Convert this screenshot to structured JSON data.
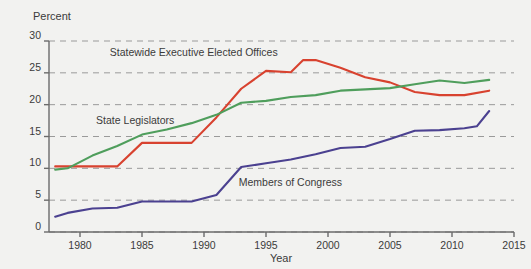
{
  "chart_data": {
    "type": "line",
    "title": "",
    "xlabel": "Year",
    "ylabel": "Percent",
    "xlim": [
      1978,
      2015
    ],
    "ylim": [
      0,
      30
    ],
    "xticks": [
      1980,
      1985,
      1990,
      1995,
      2000,
      2005,
      2010,
      2015
    ],
    "yticks": [
      0,
      5,
      10,
      15,
      20,
      25,
      30
    ],
    "grid": "horizontal-dashed",
    "legend": "inline-annotations",
    "series": [
      {
        "name": "Statewide Executive Elected Offices",
        "color": "#d8422f",
        "label_x": 1982.4,
        "label_y": 27.6,
        "x": [
          1978,
          1979,
          1981,
          1983,
          1985,
          1987,
          1989,
          1991,
          1993,
          1995,
          1997,
          1998,
          1999,
          2001,
          2003,
          2005,
          2007,
          2009,
          2011,
          2013
        ],
        "y": [
          10.3,
          10.3,
          10.3,
          10.3,
          14.0,
          14.0,
          14.0,
          18.0,
          22.5,
          25.3,
          25.1,
          27.0,
          27.0,
          25.8,
          24.3,
          23.5,
          22.0,
          21.5,
          21.5,
          22.2
        ]
      },
      {
        "name": "State Legislators",
        "color": "#4f9e5c",
        "label_x": 1981.3,
        "label_y": 17.0,
        "x": [
          1978,
          1979,
          1981,
          1983,
          1985,
          1987,
          1989,
          1991,
          1993,
          1995,
          1997,
          1999,
          2001,
          2003,
          2005,
          2007,
          2009,
          2011,
          2013
        ],
        "y": [
          9.8,
          10.0,
          12.0,
          13.5,
          15.3,
          16.1,
          17.1,
          18.4,
          20.3,
          20.6,
          21.2,
          21.5,
          22.2,
          22.4,
          22.6,
          23.2,
          23.8,
          23.4,
          23.9
        ]
      },
      {
        "name": "Members of Congress",
        "color": "#4b4190",
        "label_x": 1992.8,
        "label_y": 7.3,
        "x": [
          1978,
          1979,
          1981,
          1983,
          1985,
          1987,
          1989,
          1991,
          1993,
          1995,
          1997,
          1999,
          2001,
          2003,
          2005,
          2007,
          2009,
          2011,
          2012,
          2013
        ],
        "y": [
          2.4,
          3.0,
          3.7,
          3.8,
          4.8,
          4.8,
          4.8,
          5.8,
          10.2,
          10.8,
          11.4,
          12.2,
          13.2,
          13.4,
          14.6,
          15.9,
          16.0,
          16.3,
          16.6,
          19.0
        ]
      }
    ]
  },
  "labels": {
    "y_axis_title": "Percent",
    "x_axis_title": "Year"
  },
  "colors": {
    "background": "#f2f2f0",
    "axis": "#6b6b6b",
    "grid": "#9a9a9a",
    "text": "#3b3b3b",
    "red": "#d8422f",
    "green": "#4f9e5c",
    "purple": "#4b4190"
  }
}
